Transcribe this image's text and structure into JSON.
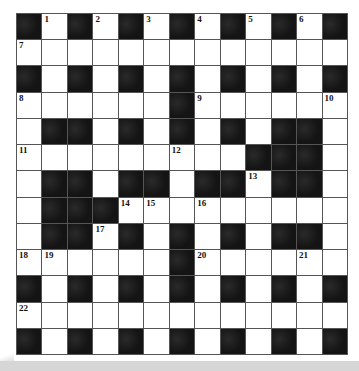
{
  "puzzle": {
    "caption_clipped": "",
    "rows": 13,
    "cols": 13,
    "layout": [
      "#.#.#.#.#.#.#",
      ".............",
      "#.#.#.#.#.#.#",
      "......#......",
      ".##.#.#.#.##.",
      ".........###.",
      ".##.##.##.##.",
      ".###.........",
      ".##.#.#.#.##.",
      "......#......",
      "#.#.#.#.#.#.#",
      ".............",
      "#.#.#.#.#.#.#"
    ],
    "numbers": [
      {
        "row": 0,
        "col": 1,
        "n": "1"
      },
      {
        "row": 0,
        "col": 3,
        "n": "2"
      },
      {
        "row": 0,
        "col": 5,
        "n": "3"
      },
      {
        "row": 0,
        "col": 7,
        "n": "4"
      },
      {
        "row": 0,
        "col": 9,
        "n": "5"
      },
      {
        "row": 0,
        "col": 11,
        "n": "6"
      },
      {
        "row": 1,
        "col": 0,
        "n": "7"
      },
      {
        "row": 3,
        "col": 0,
        "n": "8"
      },
      {
        "row": 3,
        "col": 7,
        "n": "9"
      },
      {
        "row": 3,
        "col": 12,
        "n": "10"
      },
      {
        "row": 5,
        "col": 0,
        "n": "11"
      },
      {
        "row": 5,
        "col": 6,
        "n": "12"
      },
      {
        "row": 6,
        "col": 9,
        "n": "13"
      },
      {
        "row": 7,
        "col": 4,
        "n": "14"
      },
      {
        "row": 7,
        "col": 5,
        "n": "15"
      },
      {
        "row": 7,
        "col": 7,
        "n": "16"
      },
      {
        "row": 8,
        "col": 3,
        "n": "17"
      },
      {
        "row": 9,
        "col": 0,
        "n": "18"
      },
      {
        "row": 9,
        "col": 1,
        "n": "19"
      },
      {
        "row": 9,
        "col": 7,
        "n": "20"
      },
      {
        "row": 9,
        "col": 11,
        "n": "21"
      },
      {
        "row": 11,
        "col": 0,
        "n": "22"
      }
    ],
    "colors": {
      "black_cell": "#141414",
      "white_cell": "#ffffff",
      "grid_line": "#555555",
      "footer_band": "#d6d6d6"
    }
  }
}
